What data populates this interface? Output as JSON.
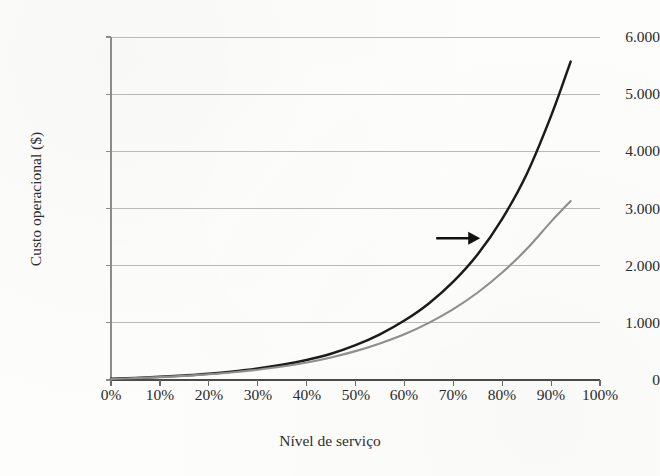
{
  "chart_data": {
    "type": "line",
    "title": "",
    "xlabel": "Nível de serviço",
    "ylabel": "Custo operacional ($)",
    "xlim": [
      0,
      100
    ],
    "ylim": [
      0,
      6000
    ],
    "grid": true,
    "legend": "none",
    "x_ticks": [
      "0%",
      "10%",
      "20%",
      "30%",
      "40%",
      "50%",
      "60%",
      "70%",
      "80%",
      "90%",
      "100%"
    ],
    "y_ticks": [
      "0",
      "1.000",
      "2.000",
      "3.000",
      "4.000",
      "5.000",
      "6.000"
    ],
    "y_tick_values": [
      0,
      1000,
      2000,
      3000,
      4000,
      5000,
      6000
    ],
    "x_tick_values": [
      0,
      10,
      20,
      30,
      40,
      50,
      60,
      70,
      80,
      90,
      100
    ],
    "series": [
      {
        "name": "Curva de custo atual",
        "color": "#1b1b1b",
        "x": [
          0,
          5,
          10,
          15,
          20,
          25,
          30,
          35,
          40,
          45,
          50,
          55,
          60,
          65,
          70,
          75,
          80,
          85,
          90,
          94
        ],
        "values": [
          20,
          35,
          55,
          80,
          110,
          150,
          200,
          265,
          350,
          460,
          610,
          800,
          1040,
          1340,
          1720,
          2200,
          2820,
          3600,
          4620,
          5570
        ]
      },
      {
        "name": "Curva de custo melhorada",
        "color": "#8e8e8e",
        "x": [
          0,
          5,
          10,
          15,
          20,
          25,
          30,
          35,
          40,
          45,
          50,
          55,
          60,
          65,
          70,
          75,
          80,
          85,
          90,
          94
        ],
        "values": [
          18,
          32,
          50,
          72,
          100,
          135,
          180,
          235,
          305,
          395,
          505,
          640,
          800,
          1000,
          1240,
          1530,
          1880,
          2290,
          2770,
          3130
        ]
      }
    ],
    "annotations": [
      {
        "name": "shift-arrow",
        "type": "arrow",
        "direction": "right",
        "x_start": 66.5,
        "x_end": 75.5,
        "y": 2480,
        "color": "#111111"
      }
    ]
  }
}
